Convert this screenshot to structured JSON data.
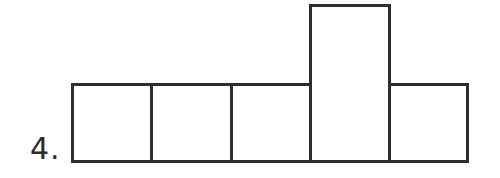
{
  "problem": {
    "number_label": "4."
  },
  "diagram": {
    "type": "net-of-squares",
    "stroke_color": "#2e2e2e",
    "background": "#ffffff",
    "boxes": [
      {
        "id": "box-1",
        "left": 71,
        "top": 83,
        "width": 82,
        "height": 80
      },
      {
        "id": "box-2",
        "left": 150,
        "top": 83,
        "width": 83,
        "height": 80
      },
      {
        "id": "box-3",
        "left": 230,
        "top": 83,
        "width": 82,
        "height": 80
      },
      {
        "id": "box-4-tall",
        "left": 309,
        "top": 4,
        "width": 82,
        "height": 159
      },
      {
        "id": "box-5",
        "left": 388,
        "top": 83,
        "width": 81,
        "height": 80
      }
    ]
  }
}
